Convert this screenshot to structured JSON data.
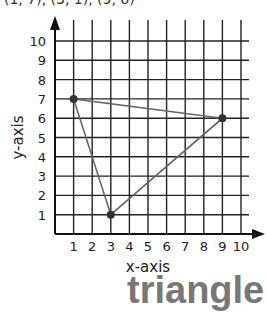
{
  "header": {
    "points_text": "(1, 7), (3, 1), (9, 6)"
  },
  "answer": {
    "label": "triangle"
  },
  "chart_data": {
    "type": "scatter",
    "title": "",
    "xlabel": "x-axis",
    "ylabel": "y-axis",
    "xlim": [
      0,
      10
    ],
    "ylim": [
      0,
      10
    ],
    "grid": true,
    "x_ticks": [
      "1",
      "2",
      "3",
      "4",
      "5",
      "6",
      "7",
      "8",
      "9",
      "10"
    ],
    "y_ticks": [
      "1",
      "2",
      "3",
      "4",
      "5",
      "6",
      "7",
      "8",
      "9",
      "10"
    ],
    "points": [
      {
        "x": 1,
        "y": 7
      },
      {
        "x": 3,
        "y": 1
      },
      {
        "x": 9,
        "y": 6
      }
    ],
    "polygon": "closed triangle connecting points",
    "answer_label": "triangle"
  },
  "colors": {
    "grid": "#222222",
    "shape": "#666666",
    "point": "#333333",
    "answer": "#777777"
  }
}
